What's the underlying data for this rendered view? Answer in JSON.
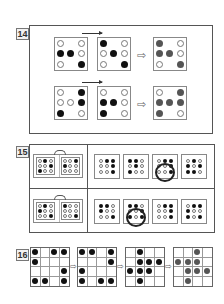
{
  "puzzles": [
    {
      "number": "14",
      "rows": [
        {
          "a": [
            "o",
            "n",
            "o",
            "b",
            "b",
            "o",
            "o",
            "n",
            "b"
          ],
          "b": [
            "b",
            "n",
            "o",
            "o",
            "b",
            "o",
            "o",
            "n",
            "b"
          ],
          "result": [
            "g",
            "n",
            "o",
            "g",
            "g",
            "o",
            "o",
            "n",
            "g"
          ]
        },
        {
          "a": [
            "o",
            "n",
            "b",
            "o",
            "o",
            "b",
            "b",
            "n",
            "o"
          ],
          "b": [
            "o",
            "n",
            "o",
            "b",
            "b",
            "o",
            "b",
            "n",
            "o"
          ],
          "result": [
            "o",
            "n",
            "g",
            "g",
            "g",
            "g",
            "g",
            "n",
            "o"
          ]
        }
      ],
      "arrow_symbol": "⇨"
    },
    {
      "number": "15",
      "rows": [
        {
          "left": [
            [
              "o",
              "b",
              "o",
              "o",
              "o",
              "b",
              "b",
              "o",
              "o"
            ],
            [
              "o",
              "o",
              "b",
              "b",
              "o",
              "o",
              "o",
              "o",
              "o"
            ]
          ],
          "options": [
            [
              "o",
              "b",
              "b",
              "o",
              "o",
              "b",
              "o",
              "o",
              "b"
            ],
            [
              "b",
              "b",
              "o",
              "o",
              "b",
              "o",
              "b",
              "o",
              "o"
            ],
            [
              "o",
              "b",
              "b",
              "o",
              "o",
              "b",
              "o",
              "o",
              "b"
            ],
            [
              "o",
              "b",
              "o",
              "b",
              "o",
              "b",
              "b",
              "b",
              "o"
            ]
          ],
          "selected_option": 3
        },
        {
          "left": [
            [
              "o",
              "b",
              "o",
              "b",
              "o",
              "o",
              "o",
              "o",
              "b"
            ],
            [
              "b",
              "o",
              "o",
              "o",
              "o",
              "o",
              "o",
              "o",
              "b"
            ]
          ],
          "options": [
            [
              "b",
              "b",
              "o",
              "b",
              "o",
              "o",
              "o",
              "o",
              "b"
            ],
            [
              "b",
              "b",
              "o",
              "o",
              "o",
              "b",
              "b",
              "o",
              "b"
            ],
            [
              "o",
              "b",
              "b",
              "o",
              "o",
              "b",
              "o",
              "o",
              "b"
            ],
            [
              "o",
              "b",
              "b",
              "b",
              "o",
              "o",
              "b",
              "o",
              "b"
            ]
          ],
          "selected_option": 2
        }
      ]
    },
    {
      "number": "16",
      "grids": [
        {
          "dots": [
            1,
            0,
            1,
            1,
            1,
            0,
            0,
            0,
            0,
            0,
            0,
            1,
            1,
            1,
            0,
            1
          ],
          "color": "black"
        },
        {
          "dots": [
            1,
            1,
            0,
            1,
            0,
            0,
            0,
            1,
            1,
            0,
            0,
            0,
            1,
            0,
            1,
            1
          ],
          "color": "black"
        },
        {
          "dots": [
            0,
            1,
            0,
            0,
            0,
            1,
            1,
            1,
            1,
            1,
            1,
            0,
            0,
            1,
            0,
            0
          ],
          "color": "black"
        },
        {
          "dots": [
            0,
            0,
            1,
            0,
            1,
            1,
            1,
            0,
            0,
            1,
            1,
            1,
            0,
            1,
            0,
            0
          ],
          "color": "gray"
        }
      ],
      "arrow_symbol": "⇨"
    }
  ],
  "colors": {
    "black": "#111111",
    "gray": "#555555",
    "frame": "#555555"
  }
}
